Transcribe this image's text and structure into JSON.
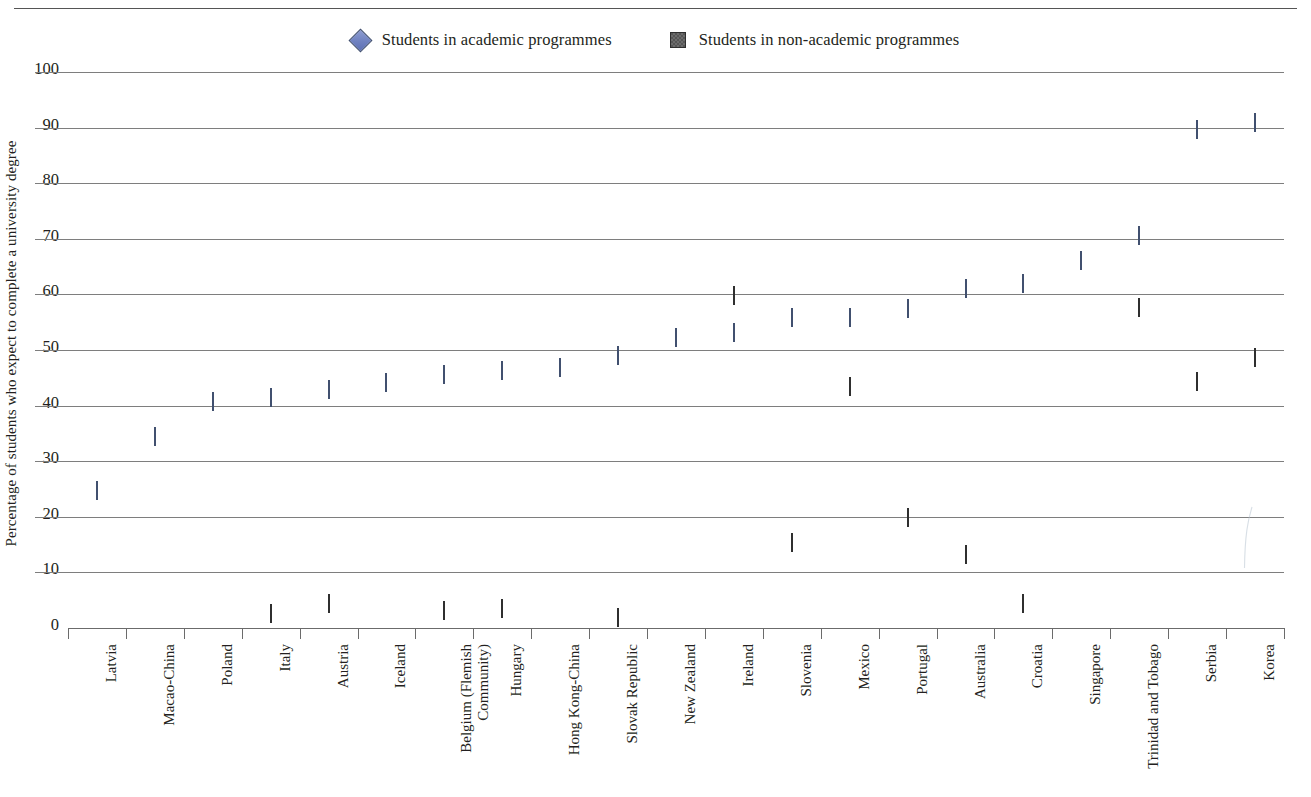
{
  "page": {
    "background": "#ffffff",
    "has_top_rule": true
  },
  "legend": {
    "position": "top-center",
    "entries": [
      {
        "marker": "diamond-marker-icon",
        "shape": "diamond",
        "color": "#6F81C0",
        "label": "Students in academic programmes"
      },
      {
        "marker": "square-marker-icon",
        "shape": "square",
        "color": "#565656",
        "label": "Students in non-academic programmes"
      }
    ]
  },
  "chart_data": {
    "type": "scatter",
    "title": "",
    "xlabel": "",
    "ylabel": "Percentage of students who expect to complete a university degree",
    "ylim": [
      0,
      100
    ],
    "ytick_step": 10,
    "yticks": [
      "0",
      "10",
      "20",
      "30",
      "40",
      "50",
      "60",
      "70",
      "80",
      "90",
      "100"
    ],
    "grid": true,
    "grid_orientation": "horizontal",
    "legend_position": "top-center",
    "categories": [
      "Latvia",
      "Macao-China",
      "Poland",
      "Italy",
      "Austria",
      "Iceland",
      "Belgium (Flemish Community)",
      "Hungary",
      "Hong Kong-China",
      "Slovak Republic",
      "New Zealand",
      "Ireland",
      "Slovenia",
      "Mexico",
      "Portugal",
      "Australia",
      "Croatia",
      "Singapore",
      "Trinidad and Tobago",
      "Serbia",
      "Korea"
    ],
    "series": [
      {
        "name": "Students in academic programmes",
        "marker": "diamond",
        "color": "#6F81C0",
        "values": [
          24.7,
          34.4,
          40.6,
          41.3,
          42.8,
          44.0,
          45.5,
          46.3,
          46.7,
          49.0,
          52.1,
          53.0,
          55.7,
          55.7,
          57.4,
          61.0,
          61.8,
          66.0,
          70.5,
          89.5,
          90.8
        ]
      },
      {
        "name": "Students in non-academic programmes",
        "marker": "square",
        "color": "#565656",
        "values": [
          null,
          null,
          null,
          2.5,
          4.3,
          null,
          3.1,
          3.4,
          null,
          1.8,
          null,
          59.8,
          15.2,
          43.4,
          19.7,
          13.2,
          4.4,
          null,
          57.6,
          44.3,
          48.5
        ]
      }
    ]
  }
}
